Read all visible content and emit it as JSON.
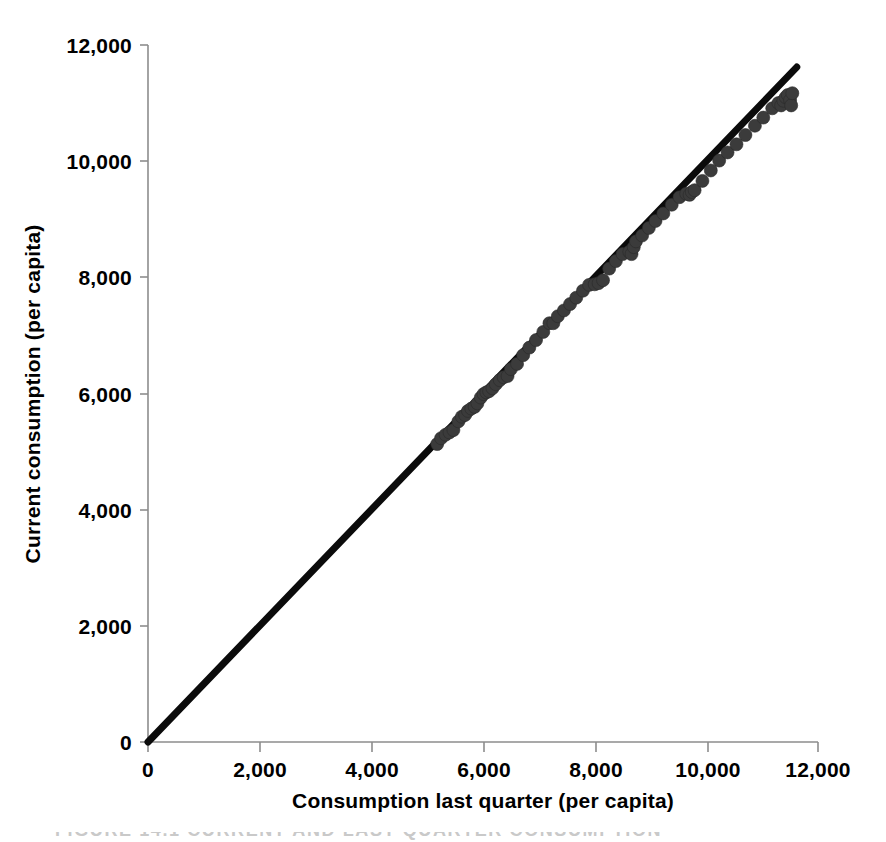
{
  "chart_data": {
    "type": "scatter",
    "title": "",
    "xlabel": "Consumption last quarter (per capita)",
    "ylabel": "Current consumption (per capita)",
    "xlim": [
      0,
      12000
    ],
    "ylim": [
      0,
      12000
    ],
    "grid": false,
    "legend": "none",
    "xticks": [
      "0",
      "2,000",
      "4,000",
      "6,000",
      "8,000",
      "10,000",
      "12,000"
    ],
    "xtick_values": [
      0,
      2000,
      4000,
      6000,
      8000,
      10000,
      12000
    ],
    "yticks": [
      "0",
      "2,000",
      "4,000",
      "6,000",
      "8,000",
      "10,000",
      "12,000"
    ],
    "ytick_values": [
      0,
      2000,
      4000,
      6000,
      8000,
      10000,
      12000
    ],
    "reference_line": {
      "name": "identity / regression line",
      "from": [
        0,
        0
      ],
      "to": [
        11620,
        11620
      ],
      "color": "#0b0b0b",
      "width_px": 7
    },
    "marker": {
      "shape": "circle",
      "color": "#3b3b3b",
      "radius_px": 6.5
    },
    "points": [
      [
        5180,
        5130
      ],
      [
        5250,
        5230
      ],
      [
        5330,
        5290
      ],
      [
        5400,
        5330
      ],
      [
        5470,
        5370
      ],
      [
        5560,
        5520
      ],
      [
        5620,
        5600
      ],
      [
        5680,
        5630
      ],
      [
        5730,
        5700
      ],
      [
        5790,
        5740
      ],
      [
        5850,
        5770
      ],
      [
        5900,
        5830
      ],
      [
        5960,
        5930
      ],
      [
        6010,
        5990
      ],
      [
        6060,
        6020
      ],
      [
        6110,
        6040
      ],
      [
        6170,
        6090
      ],
      [
        6230,
        6160
      ],
      [
        6300,
        6230
      ],
      [
        6370,
        6280
      ],
      [
        6440,
        6300
      ],
      [
        6500,
        6420
      ],
      [
        6610,
        6510
      ],
      [
        6720,
        6660
      ],
      [
        6830,
        6790
      ],
      [
        6950,
        6920
      ],
      [
        7080,
        7060
      ],
      [
        7190,
        7210
      ],
      [
        7260,
        7210
      ],
      [
        7340,
        7330
      ],
      [
        7450,
        7430
      ],
      [
        7560,
        7540
      ],
      [
        7670,
        7650
      ],
      [
        7790,
        7770
      ],
      [
        7900,
        7870
      ],
      [
        8000,
        7880
      ],
      [
        8070,
        7900
      ],
      [
        8150,
        7950
      ],
      [
        8260,
        8150
      ],
      [
        8380,
        8280
      ],
      [
        8500,
        8400
      ],
      [
        8620,
        8440
      ],
      [
        8660,
        8400
      ],
      [
        8700,
        8520
      ],
      [
        8740,
        8620
      ],
      [
        8850,
        8720
      ],
      [
        8970,
        8850
      ],
      [
        9090,
        8970
      ],
      [
        9230,
        9100
      ],
      [
        9380,
        9250
      ],
      [
        9520,
        9380
      ],
      [
        9640,
        9440
      ],
      [
        9700,
        9420
      ],
      [
        9740,
        9470
      ],
      [
        9790,
        9500
      ],
      [
        9930,
        9660
      ],
      [
        10080,
        9840
      ],
      [
        10230,
        10010
      ],
      [
        10380,
        10150
      ],
      [
        10540,
        10290
      ],
      [
        10700,
        10450
      ],
      [
        10870,
        10610
      ],
      [
        11020,
        10750
      ],
      [
        11180,
        10910
      ],
      [
        11290,
        11000
      ],
      [
        11340,
        10960
      ],
      [
        11380,
        11040
      ],
      [
        11420,
        11100
      ],
      [
        11460,
        11140
      ],
      [
        11500,
        11050
      ],
      [
        11520,
        10960
      ],
      [
        11540,
        11170
      ]
    ]
  },
  "axes": {
    "x_title": "Consumption last quarter (per capita)",
    "y_title": "Current consumption (per capita)"
  },
  "caption": {
    "text": "FIGURE 14.1   CURRENT AND LAST QUARTER CONSUMPTION"
  }
}
